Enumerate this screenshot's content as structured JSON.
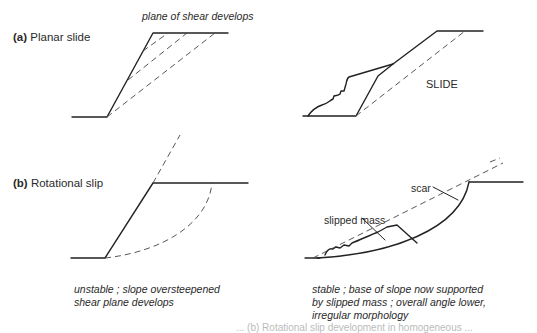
{
  "panels": {
    "a": {
      "tag": "(a)",
      "title": "Planar slide",
      "annotation_top": "plane of shear develops",
      "slide_label": "SLIDE"
    },
    "b": {
      "tag": "(b)",
      "title": "Rotational slip",
      "label_scar": "scar",
      "label_slipped_mass": "slipped mass"
    }
  },
  "notes": {
    "left_line1": "unstable ; slope oversteepened",
    "left_line2": "shear plane develops",
    "right_line1": "stable ; base of slope now supported",
    "right_line2": "by slipped mass ; overall angle lower,",
    "right_line3": "irregular morphology"
  },
  "caption_partial": "... (b) Rotational slip development in homogeneous ..."
}
